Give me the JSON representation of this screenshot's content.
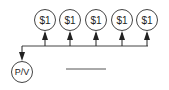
{
  "diagram": {
    "payments": [
      {
        "label": "$1"
      },
      {
        "label": "$1"
      },
      {
        "label": "$1"
      },
      {
        "label": "$1"
      },
      {
        "label": "$1"
      }
    ],
    "present_value": {
      "label": "P/V"
    },
    "answer_blank": {
      "value": ""
    },
    "colors": {
      "stroke": "#333333",
      "text": "#222222",
      "background": "#ffffff"
    }
  }
}
